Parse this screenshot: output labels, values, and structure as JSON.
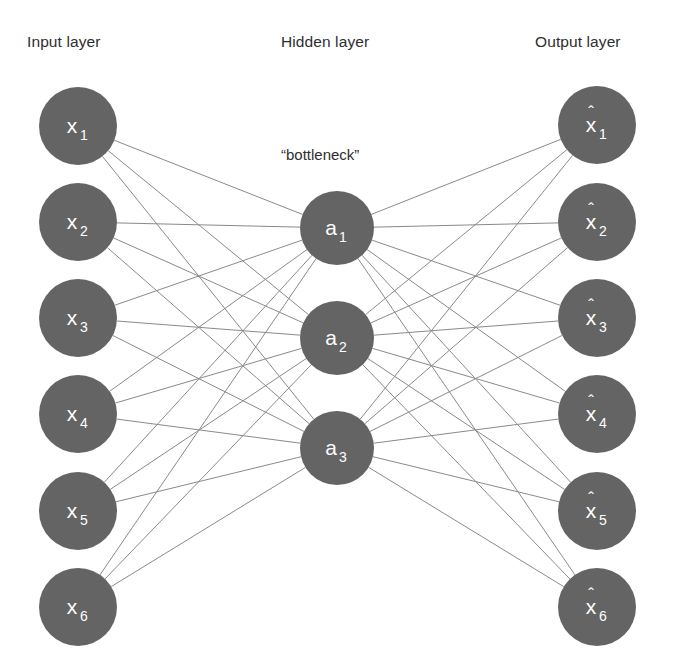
{
  "figure": {
    "type": "neural-network-diagram",
    "background_color": "#ffffff",
    "node_fill_color": "#646464",
    "edge_color": "#8a8a8a",
    "label_color": "#2e2e2e",
    "node_label_color": "#ffffff"
  },
  "titles": {
    "input": "Input layer",
    "hidden": "Hidden layer",
    "output": "Output layer"
  },
  "annotations": {
    "bottleneck": "“bottleneck”"
  },
  "layers": {
    "input": {
      "name": "Input layer",
      "count": 6,
      "center_x": 78,
      "radius": 39,
      "nodes": [
        {
          "id": "x1",
          "symbol": "x",
          "subscript": "1",
          "hat": false,
          "cx": 78,
          "cy": 126
        },
        {
          "id": "x2",
          "symbol": "x",
          "subscript": "2",
          "hat": false,
          "cx": 78,
          "cy": 222
        },
        {
          "id": "x3",
          "symbol": "x",
          "subscript": "3",
          "hat": false,
          "cx": 78,
          "cy": 318
        },
        {
          "id": "x4",
          "symbol": "x",
          "subscript": "4",
          "hat": false,
          "cx": 78,
          "cy": 414
        },
        {
          "id": "x5",
          "symbol": "x",
          "subscript": "5",
          "hat": false,
          "cx": 78,
          "cy": 511
        },
        {
          "id": "x6",
          "symbol": "x",
          "subscript": "6",
          "hat": false,
          "cx": 78,
          "cy": 607
        }
      ]
    },
    "hidden": {
      "name": "Hidden layer",
      "count": 3,
      "center_x": 337,
      "radius": 37,
      "nodes": [
        {
          "id": "a1",
          "symbol": "a",
          "subscript": "1",
          "hat": false,
          "cx": 337,
          "cy": 228
        },
        {
          "id": "a2",
          "symbol": "a",
          "subscript": "2",
          "hat": false,
          "cx": 337,
          "cy": 338
        },
        {
          "id": "a3",
          "symbol": "a",
          "subscript": "3",
          "hat": false,
          "cx": 337,
          "cy": 448
        }
      ]
    },
    "output": {
      "name": "Output layer",
      "count": 6,
      "center_x": 597,
      "radius": 39,
      "nodes": [
        {
          "id": "xhat1",
          "symbol": "x",
          "subscript": "1",
          "hat": true,
          "cx": 597,
          "cy": 125
        },
        {
          "id": "xhat2",
          "symbol": "x",
          "subscript": "2",
          "hat": true,
          "cx": 597,
          "cy": 222
        },
        {
          "id": "xhat3",
          "symbol": "x",
          "subscript": "3",
          "hat": true,
          "cx": 597,
          "cy": 318
        },
        {
          "id": "xhat4",
          "symbol": "x",
          "subscript": "4",
          "hat": true,
          "cx": 597,
          "cy": 414
        },
        {
          "id": "xhat5",
          "symbol": "x",
          "subscript": "5",
          "hat": true,
          "cx": 597,
          "cy": 511
        },
        {
          "id": "xhat6",
          "symbol": "x",
          "subscript": "6",
          "hat": true,
          "cx": 597,
          "cy": 607
        }
      ]
    }
  },
  "connections": {
    "encoder": {
      "from": "input",
      "to": "hidden",
      "fully_connected": true,
      "edge_count": 18
    },
    "decoder": {
      "from": "hidden",
      "to": "output",
      "fully_connected": true,
      "edge_count": 18
    }
  }
}
